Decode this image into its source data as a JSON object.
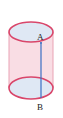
{
  "diagram": {
    "type": "cylinder",
    "labels": {
      "top_point": "A",
      "bottom_point": "B"
    },
    "colors": {
      "outline": "#d9466a",
      "body_fill": "#f9dde4",
      "ellipse_fill": "#dfe8f4",
      "segment": "#3a6fc4"
    }
  }
}
